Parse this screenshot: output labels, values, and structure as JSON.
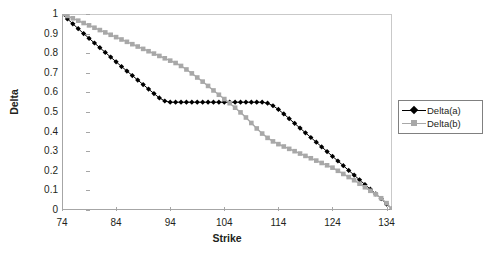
{
  "chart_data": {
    "type": "line",
    "title": "",
    "xlabel": "Strike",
    "ylabel": "Delta",
    "xlim": [
      74,
      135
    ],
    "ylim": [
      0,
      1
    ],
    "grid": false,
    "legend_position": "right",
    "xticks": [
      74,
      84,
      94,
      104,
      114,
      124,
      134
    ],
    "yticks": [
      "0",
      "0.1",
      "0.2",
      "0.3",
      "0.4",
      "0.5",
      "0.6",
      "0.7",
      "0.8",
      "0.9",
      "1"
    ],
    "x": [
      74,
      75,
      76,
      77,
      78,
      79,
      80,
      81,
      82,
      83,
      84,
      85,
      86,
      87,
      88,
      89,
      90,
      91,
      92,
      93,
      94,
      95,
      96,
      97,
      98,
      99,
      100,
      101,
      102,
      103,
      104,
      105,
      106,
      107,
      108,
      109,
      110,
      111,
      112,
      113,
      114,
      115,
      116,
      117,
      118,
      119,
      120,
      121,
      122,
      123,
      124,
      125,
      126,
      127,
      128,
      129,
      130,
      131,
      132,
      133,
      134,
      135
    ],
    "series": [
      {
        "name": "Delta(a)",
        "color": "#000000",
        "marker": "diamond",
        "values": [
          1.0,
          0.975,
          0.95,
          0.925,
          0.9,
          0.876,
          0.852,
          0.828,
          0.804,
          0.78,
          0.756,
          0.732,
          0.709,
          0.686,
          0.663,
          0.64,
          0.617,
          0.594,
          0.572,
          0.556,
          0.55,
          0.55,
          0.55,
          0.55,
          0.55,
          0.55,
          0.55,
          0.55,
          0.55,
          0.55,
          0.55,
          0.55,
          0.55,
          0.55,
          0.55,
          0.55,
          0.55,
          0.55,
          0.545,
          0.532,
          0.513,
          0.49,
          0.466,
          0.442,
          0.418,
          0.394,
          0.37,
          0.346,
          0.322,
          0.298,
          0.274,
          0.25,
          0.226,
          0.202,
          0.178,
          0.154,
          0.13,
          0.106,
          0.082,
          0.058,
          0.03,
          0.005
        ]
      },
      {
        "name": "Delta(b)",
        "color": "#a8a8a8",
        "marker": "square",
        "values": [
          1.0,
          0.99,
          0.978,
          0.966,
          0.954,
          0.942,
          0.93,
          0.918,
          0.906,
          0.894,
          0.882,
          0.87,
          0.858,
          0.846,
          0.834,
          0.822,
          0.81,
          0.798,
          0.786,
          0.774,
          0.762,
          0.75,
          0.735,
          0.717,
          0.697,
          0.676,
          0.655,
          0.633,
          0.61,
          0.588,
          0.566,
          0.545,
          0.522,
          0.498,
          0.472,
          0.444,
          0.416,
          0.39,
          0.368,
          0.35,
          0.336,
          0.324,
          0.312,
          0.3,
          0.288,
          0.276,
          0.264,
          0.252,
          0.24,
          0.228,
          0.216,
          0.2,
          0.184,
          0.168,
          0.152,
          0.134,
          0.116,
          0.098,
          0.08,
          0.06,
          0.035,
          0.005
        ]
      }
    ]
  },
  "legend": {
    "items": [
      {
        "label": "Delta(a)"
      },
      {
        "label": "Delta(b)"
      }
    ]
  },
  "colors": {
    "series_a": "#000000",
    "series_b": "#a8a8a8",
    "axis": "#a6a6a6",
    "frame": "#c9c9c9",
    "text": "#231f20",
    "background": "#ffffff"
  }
}
